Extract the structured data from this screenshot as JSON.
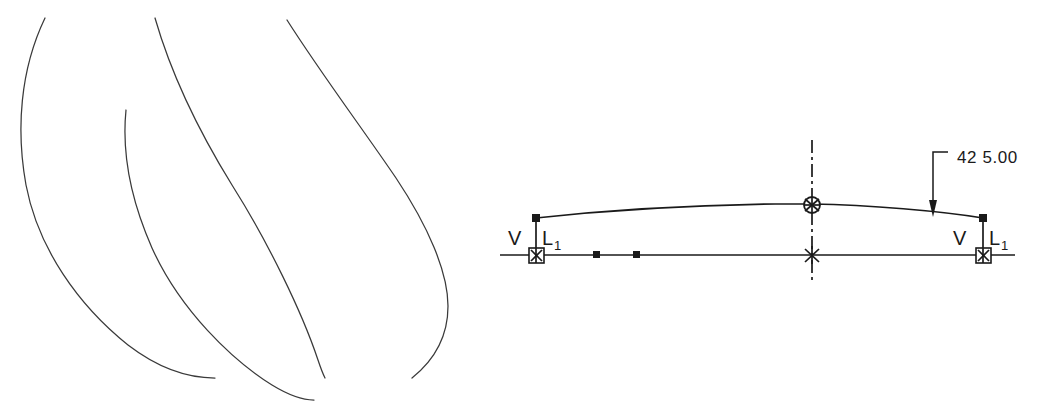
{
  "drawing": {
    "title": "CAD sketch with freehand profile curves and dimensioned arc",
    "background_color": "#ffffff",
    "stroke_color": "#1a1a1a",
    "sketch_color": "#3a3a3a",
    "width": 1037,
    "height": 410
  },
  "freehand_panel": {
    "name": "freehand-profile-sketch",
    "curve_count": 4,
    "curves": [
      {
        "id": "outer-left-curve",
        "path": "M45,18 C20,70 16,130 26,185 C38,248 78,305 128,345 C158,368 188,378 215,378"
      },
      {
        "id": "inner-left-curve",
        "path": "M126,110 C122,150 130,198 152,248 C180,310 232,360 272,385 C290,396 305,400 314,400"
      },
      {
        "id": "middle-curve",
        "path": "M155,18 C170,70 198,130 232,185 C268,242 302,312 318,360 C322,372 324,376 325,378"
      },
      {
        "id": "right-curve",
        "path": "M287,20 C320,72 362,128 396,178 C428,226 448,272 448,306 C448,338 432,362 412,378"
      }
    ]
  },
  "cad_panel": {
    "name": "dimensioned-arc-sketch",
    "baseline": {
      "name": "construction-baseline",
      "x1": 500,
      "y1": 255,
      "x2": 1015,
      "y2": 255
    },
    "arc": {
      "name": "profile-arc",
      "path": "M536,218 C610,210 700,205 775,204 L812,204 C870,205 940,211 983,218",
      "left_endpoint": [
        536,
        218
      ],
      "right_endpoint": [
        983,
        218
      ],
      "apex": [
        812,
        204
      ]
    },
    "centerline": {
      "name": "vertical-centerline",
      "x": 812,
      "y1": 140,
      "y2": 283
    },
    "points": [
      {
        "id": "baseline-point-1",
        "x": 597,
        "y": 255,
        "marker": "square"
      },
      {
        "id": "baseline-point-2",
        "x": 637,
        "y": 255,
        "marker": "square"
      }
    ],
    "nodes": [
      {
        "id": "arc-left-node",
        "x": 536,
        "y": 218,
        "marker": "square"
      },
      {
        "id": "arc-right-node",
        "x": 983,
        "y": 218,
        "marker": "square"
      },
      {
        "id": "arc-apex-node",
        "x": 812,
        "y": 205,
        "marker": "circle-cross"
      },
      {
        "id": "baseline-left-node",
        "x": 536,
        "y": 255,
        "marker": "boxed-cross"
      },
      {
        "id": "baseline-center-node",
        "x": 812,
        "y": 255,
        "marker": "cross"
      },
      {
        "id": "baseline-right-node",
        "x": 983,
        "y": 255,
        "marker": "boxed-cross"
      }
    ],
    "dimension": {
      "name": "overall-length-dimension",
      "value": "42 5.00",
      "value_numeric": 425.0,
      "leader": {
        "shoulder_x1": 933,
        "shoulder_x2": 948,
        "shoulder_y": 152,
        "vertical_x": 933,
        "vertical_y1": 152,
        "arrow_tip_y": 216
      },
      "text_x": 957,
      "text_y": 163
    },
    "constraints": [
      {
        "id": "constraint-left-vertical",
        "symbol": "V",
        "x": 510,
        "y": 245
      },
      {
        "id": "constraint-left-length",
        "symbol": "L",
        "subscript": "1",
        "x": 543,
        "y": 245
      },
      {
        "id": "constraint-right-vertical",
        "symbol": "V",
        "x": 955,
        "y": 245
      },
      {
        "id": "constraint-right-length",
        "symbol": "L",
        "subscript": "1",
        "x": 990,
        "y": 245
      }
    ]
  }
}
